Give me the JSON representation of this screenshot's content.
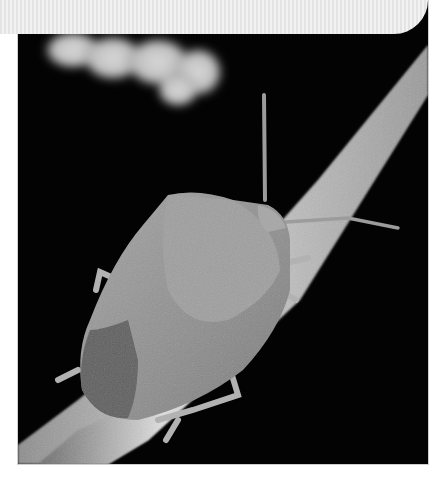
{
  "image": {
    "subject": "shield bug on twig",
    "style": "grayscale macro photograph",
    "background_color": "#030303",
    "page_background": "#ffffff"
  },
  "banner": {
    "color": "#ececec",
    "shape": "rounded-bottom-right"
  }
}
